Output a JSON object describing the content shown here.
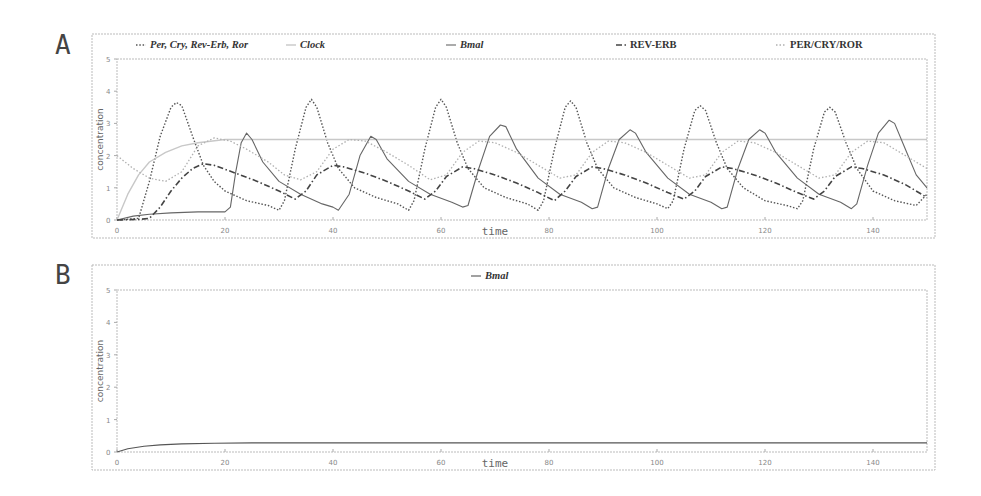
{
  "panels": [
    {
      "letter": "A"
    },
    {
      "letter": "B"
    }
  ],
  "chart_data": [
    {
      "type": "line",
      "panel": "A",
      "xlabel": "time",
      "ylabel": "concentration",
      "xlim": [
        0,
        150
      ],
      "ylim": [
        0,
        5
      ],
      "xticks": [
        0,
        20,
        40,
        60,
        80,
        100,
        120,
        140
      ],
      "yticks": [
        0,
        1,
        2,
        3,
        4,
        5
      ],
      "legend_position": "top",
      "legend": [
        "Per, Cry, Rev-Erb, Ror",
        "Clock",
        "Bmal",
        "REV-ERB",
        "PER/CRY/ROR"
      ],
      "series": [
        {
          "name": "Per, Cry, Rev-Erb, Ror",
          "style": "dotted",
          "color": "#555555",
          "points": [
            [
              0,
              0
            ],
            [
              4,
              0.05
            ],
            [
              6,
              1.2
            ],
            [
              8,
              2.6
            ],
            [
              10,
              3.5
            ],
            [
              11,
              3.65
            ],
            [
              12,
              3.55
            ],
            [
              14,
              2.6
            ],
            [
              16,
              1.7
            ],
            [
              18,
              1.2
            ],
            [
              20,
              0.9
            ],
            [
              24,
              0.6
            ],
            [
              28,
              0.45
            ],
            [
              30,
              0.3
            ],
            [
              31,
              0.6
            ],
            [
              33,
              2.2
            ],
            [
              35,
              3.5
            ],
            [
              36,
              3.75
            ],
            [
              37,
              3.5
            ],
            [
              39,
              2.4
            ],
            [
              41,
              1.6
            ],
            [
              44,
              1.0
            ],
            [
              48,
              0.7
            ],
            [
              52,
              0.5
            ],
            [
              54,
              0.3
            ],
            [
              55,
              0.6
            ],
            [
              57,
              2.2
            ],
            [
              59,
              3.5
            ],
            [
              60,
              3.75
            ],
            [
              61,
              3.5
            ],
            [
              63,
              2.4
            ],
            [
              65,
              1.6
            ],
            [
              68,
              1.0
            ],
            [
              72,
              0.7
            ],
            [
              76,
              0.5
            ],
            [
              78,
              0.3
            ],
            [
              79,
              0.6
            ],
            [
              81,
              2.2
            ],
            [
              83,
              3.5
            ],
            [
              84,
              3.7
            ],
            [
              85,
              3.5
            ],
            [
              87,
              2.4
            ],
            [
              89,
              1.6
            ],
            [
              92,
              1.0
            ],
            [
              96,
              0.7
            ],
            [
              100,
              0.5
            ],
            [
              102,
              0.35
            ],
            [
              103,
              0.6
            ],
            [
              105,
              2.2
            ],
            [
              107,
              3.4
            ],
            [
              108,
              3.55
            ],
            [
              109,
              3.4
            ],
            [
              111,
              2.4
            ],
            [
              113,
              1.6
            ],
            [
              116,
              1.0
            ],
            [
              120,
              0.6
            ],
            [
              124,
              0.45
            ],
            [
              126,
              0.35
            ],
            [
              127,
              0.6
            ],
            [
              129,
              2.2
            ],
            [
              131,
              3.35
            ],
            [
              132,
              3.5
            ],
            [
              133,
              3.35
            ],
            [
              135,
              2.4
            ],
            [
              137,
              1.6
            ],
            [
              140,
              0.9
            ],
            [
              144,
              0.6
            ],
            [
              148,
              0.45
            ],
            [
              150,
              0.8
            ]
          ]
        },
        {
          "name": "Clock",
          "style": "solid-light",
          "color": "#c8c8c8",
          "points": [
            [
              0,
              0
            ],
            [
              2,
              0.8
            ],
            [
              4,
              1.4
            ],
            [
              6,
              1.8
            ],
            [
              9,
              2.1
            ],
            [
              12,
              2.3
            ],
            [
              15,
              2.4
            ],
            [
              20,
              2.5
            ],
            [
              150,
              2.5
            ]
          ]
        },
        {
          "name": "Bmal",
          "style": "solid",
          "color": "#666666",
          "points": [
            [
              0,
              0
            ],
            [
              3,
              0.12
            ],
            [
              6,
              0.18
            ],
            [
              10,
              0.22
            ],
            [
              15,
              0.25
            ],
            [
              20,
              0.25
            ],
            [
              21,
              0.4
            ],
            [
              22,
              1.5
            ],
            [
              23,
              2.4
            ],
            [
              24,
              2.7
            ],
            [
              25,
              2.5
            ],
            [
              27,
              1.8
            ],
            [
              30,
              1.2
            ],
            [
              34,
              0.8
            ],
            [
              38,
              0.5
            ],
            [
              40,
              0.4
            ],
            [
              41,
              0.3
            ],
            [
              43,
              0.8
            ],
            [
              45,
              2.0
            ],
            [
              47,
              2.6
            ],
            [
              48,
              2.5
            ],
            [
              50,
              1.9
            ],
            [
              54,
              1.2
            ],
            [
              58,
              0.8
            ],
            [
              62,
              0.55
            ],
            [
              64,
              0.4
            ],
            [
              65,
              0.45
            ],
            [
              67,
              1.6
            ],
            [
              69,
              2.6
            ],
            [
              71,
              2.95
            ],
            [
              72,
              2.9
            ],
            [
              74,
              2.2
            ],
            [
              78,
              1.3
            ],
            [
              82,
              0.8
            ],
            [
              86,
              0.55
            ],
            [
              88,
              0.35
            ],
            [
              89,
              0.4
            ],
            [
              91,
              1.6
            ],
            [
              93,
              2.5
            ],
            [
              95,
              2.8
            ],
            [
              96,
              2.7
            ],
            [
              98,
              2.1
            ],
            [
              102,
              1.3
            ],
            [
              106,
              0.8
            ],
            [
              110,
              0.55
            ],
            [
              112,
              0.35
            ],
            [
              113,
              0.4
            ],
            [
              115,
              1.6
            ],
            [
              117,
              2.5
            ],
            [
              119,
              2.8
            ],
            [
              120,
              2.7
            ],
            [
              122,
              2.1
            ],
            [
              126,
              1.3
            ],
            [
              130,
              0.8
            ],
            [
              134,
              0.55
            ],
            [
              136,
              0.35
            ],
            [
              137,
              0.5
            ],
            [
              139,
              1.7
            ],
            [
              141,
              2.7
            ],
            [
              143,
              3.1
            ],
            [
              144,
              3.0
            ],
            [
              146,
              2.2
            ],
            [
              148,
              1.4
            ],
            [
              150,
              1.0
            ]
          ]
        },
        {
          "name": "REV-ERB",
          "style": "dash-dot",
          "color": "#444444",
          "points": [
            [
              0,
              0
            ],
            [
              4,
              0.02
            ],
            [
              6,
              0.05
            ],
            [
              8,
              0.4
            ],
            [
              10,
              0.9
            ],
            [
              12,
              1.3
            ],
            [
              14,
              1.6
            ],
            [
              16,
              1.75
            ],
            [
              18,
              1.7
            ],
            [
              22,
              1.45
            ],
            [
              26,
              1.2
            ],
            [
              30,
              0.9
            ],
            [
              33,
              0.65
            ],
            [
              35,
              0.9
            ],
            [
              37,
              1.4
            ],
            [
              40,
              1.7
            ],
            [
              42,
              1.65
            ],
            [
              46,
              1.45
            ],
            [
              50,
              1.2
            ],
            [
              54,
              0.9
            ],
            [
              57,
              0.65
            ],
            [
              59,
              0.9
            ],
            [
              61,
              1.35
            ],
            [
              64,
              1.65
            ],
            [
              66,
              1.6
            ],
            [
              70,
              1.4
            ],
            [
              74,
              1.15
            ],
            [
              78,
              0.85
            ],
            [
              81,
              0.6
            ],
            [
              83,
              0.9
            ],
            [
              85,
              1.35
            ],
            [
              88,
              1.65
            ],
            [
              90,
              1.6
            ],
            [
              94,
              1.4
            ],
            [
              98,
              1.15
            ],
            [
              102,
              0.85
            ],
            [
              105,
              0.65
            ],
            [
              107,
              0.9
            ],
            [
              109,
              1.35
            ],
            [
              112,
              1.65
            ],
            [
              114,
              1.6
            ],
            [
              118,
              1.4
            ],
            [
              122,
              1.15
            ],
            [
              126,
              0.85
            ],
            [
              129,
              0.65
            ],
            [
              131,
              0.9
            ],
            [
              133,
              1.35
            ],
            [
              136,
              1.65
            ],
            [
              138,
              1.6
            ],
            [
              142,
              1.4
            ],
            [
              146,
              1.1
            ],
            [
              150,
              0.7
            ]
          ]
        },
        {
          "name": "PER/CRY/ROR",
          "style": "dotted-light",
          "color": "#b0b0b0",
          "points": [
            [
              0,
              2.0
            ],
            [
              3,
              1.6
            ],
            [
              6,
              1.3
            ],
            [
              9,
              1.2
            ],
            [
              12,
              1.5
            ],
            [
              15,
              2.3
            ],
            [
              18,
              2.55
            ],
            [
              21,
              2.45
            ],
            [
              24,
              2.2
            ],
            [
              28,
              1.8
            ],
            [
              31,
              1.4
            ],
            [
              34,
              1.25
            ],
            [
              37,
              1.5
            ],
            [
              40,
              2.2
            ],
            [
              43,
              2.5
            ],
            [
              46,
              2.45
            ],
            [
              50,
              2.1
            ],
            [
              54,
              1.7
            ],
            [
              58,
              1.25
            ],
            [
              61,
              1.4
            ],
            [
              64,
              2.1
            ],
            [
              67,
              2.45
            ],
            [
              70,
              2.4
            ],
            [
              74,
              2.1
            ],
            [
              78,
              1.7
            ],
            [
              82,
              1.3
            ],
            [
              85,
              1.4
            ],
            [
              88,
              2.1
            ],
            [
              91,
              2.45
            ],
            [
              94,
              2.4
            ],
            [
              98,
              2.1
            ],
            [
              102,
              1.7
            ],
            [
              106,
              1.3
            ],
            [
              109,
              1.4
            ],
            [
              112,
              2.1
            ],
            [
              115,
              2.45
            ],
            [
              118,
              2.4
            ],
            [
              122,
              2.1
            ],
            [
              126,
              1.7
            ],
            [
              130,
              1.3
            ],
            [
              133,
              1.4
            ],
            [
              136,
              2.1
            ],
            [
              139,
              2.45
            ],
            [
              142,
              2.4
            ],
            [
              146,
              2.0
            ],
            [
              150,
              1.6
            ]
          ]
        }
      ]
    },
    {
      "type": "line",
      "panel": "B",
      "xlabel": "time",
      "ylabel": "concentration",
      "xlim": [
        0,
        150
      ],
      "ylim": [
        0,
        5
      ],
      "xticks": [
        0,
        20,
        40,
        60,
        80,
        100,
        120,
        140
      ],
      "yticks": [
        0,
        1,
        2,
        3,
        4,
        5
      ],
      "legend_position": "top",
      "legend": [
        "Bmal"
      ],
      "series": [
        {
          "name": "Bmal",
          "style": "solid",
          "color": "#555555",
          "points": [
            [
              0,
              0
            ],
            [
              2,
              0.1
            ],
            [
              5,
              0.18
            ],
            [
              8,
              0.22
            ],
            [
              12,
              0.25
            ],
            [
              18,
              0.27
            ],
            [
              25,
              0.28
            ],
            [
              150,
              0.28
            ]
          ]
        }
      ]
    }
  ]
}
